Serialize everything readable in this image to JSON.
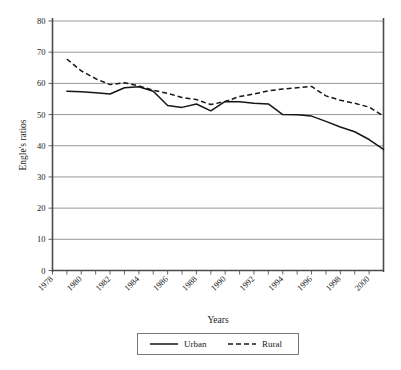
{
  "chart_data": {
    "type": "line",
    "title": "",
    "xlabel": "Years",
    "ylabel": "Engle's ratios",
    "xlim": [
      1978,
      2001
    ],
    "ylim": [
      0,
      80
    ],
    "ytick_step": 10,
    "yticks": [
      0,
      10,
      20,
      30,
      40,
      50,
      60,
      70,
      80
    ],
    "xticks_labeled": [
      1978,
      1980,
      1982,
      1984,
      1986,
      1988,
      1990,
      1992,
      1994,
      1996,
      1998,
      2000
    ],
    "xticks_all": [
      1978,
      1979,
      1980,
      1981,
      1982,
      1983,
      1984,
      1985,
      1986,
      1987,
      1988,
      1989,
      1990,
      1991,
      1992,
      1993,
      1994,
      1995,
      1996,
      1997,
      1998,
      1999,
      2000,
      2001
    ],
    "grid": "horizontal",
    "legend_position": "bottom",
    "x": [
      1979,
      1980,
      1981,
      1982,
      1983,
      1984,
      1985,
      1986,
      1987,
      1988,
      1989,
      1990,
      1991,
      1992,
      1993,
      1994,
      1995,
      1996,
      1997,
      1998,
      1999,
      2000,
      2001
    ],
    "series": [
      {
        "name": "Urban",
        "style": "solid",
        "color": "#161616",
        "values": [
          57.5,
          57.3,
          57.0,
          56.6,
          58.6,
          58.9,
          57.5,
          52.9,
          52.3,
          53.4,
          51.2,
          54.2,
          54.1,
          53.6,
          53.4,
          50.0,
          49.9,
          49.5,
          47.8,
          46.0,
          44.5,
          42.0,
          38.8
        ]
      },
      {
        "name": "Rural",
        "style": "dashed",
        "color": "#161616",
        "values": [
          67.8,
          64.0,
          61.5,
          59.6,
          60.2,
          59.2,
          57.8,
          56.8,
          55.5,
          54.8,
          53.2,
          54.2,
          55.8,
          56.6,
          57.6,
          58.2,
          58.6,
          59.0,
          56.0,
          54.6,
          53.6,
          52.4,
          49.5
        ]
      }
    ],
    "legend": [
      {
        "label": "Urban",
        "style": "solid"
      },
      {
        "label": "Rural",
        "style": "dashed"
      }
    ]
  },
  "axis": {
    "y_title": "Engle's ratios",
    "x_title": "Years",
    "y_tick_labels": [
      "80",
      "70",
      "60",
      "50",
      "40",
      "30",
      "20",
      "10",
      "0"
    ],
    "x_tick_labels": [
      "1978",
      "1980",
      "1982",
      "1984",
      "1986",
      "1988",
      "1990",
      "1992",
      "1994",
      "1996",
      "1998",
      "2000"
    ]
  },
  "legend": {
    "urban_label": "Urban",
    "rural_label": "Rural"
  }
}
